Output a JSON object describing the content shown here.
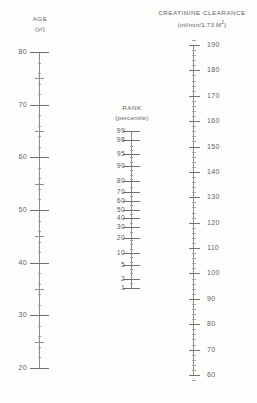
{
  "figure": {
    "type": "nomogram",
    "background_color": "#fdfdfc",
    "ink_color": "#6e6e6e"
  },
  "age_axis": {
    "title": "AGE",
    "subtitle": "(yr)",
    "unit": "yr",
    "label_side": "left",
    "scale": "linear",
    "range": [
      20,
      80
    ],
    "top_value": 80,
    "bottom_value": 20,
    "top_y": 52,
    "bottom_y": 368,
    "major_step": 10,
    "mid_step": 5,
    "minor_step": 2,
    "major_ticks": [
      80,
      70,
      60,
      50,
      40,
      30,
      20
    ],
    "labels": [
      "80",
      "70",
      "60",
      "50",
      "40",
      "30",
      "20"
    ]
  },
  "rank_axis": {
    "title": "RANK",
    "subtitle": "(percentile)",
    "unit": "percentile",
    "label_side": "left",
    "scale": "probit",
    "top_y": 131,
    "bottom_y": 288,
    "ticks": [
      99,
      98,
      95,
      90,
      80,
      70,
      60,
      50,
      40,
      30,
      20,
      10,
      5,
      2,
      1
    ],
    "labels": [
      "99",
      "98",
      "95",
      "90",
      "80",
      "70",
      "60",
      "50",
      "40",
      "30",
      "20",
      "10",
      "5",
      "2",
      "1"
    ]
  },
  "clearance_axis": {
    "title": "CREATININE CLEARANCE",
    "subtitle": "(ml/min/1.73 M²)",
    "subtitle_parts": {
      "pre": "(ml/min/1.73 M",
      "sup": "2",
      "post": ")"
    },
    "unit": "ml/min/1.73 M2",
    "label_side": "right",
    "scale": "linear",
    "range": [
      60,
      190
    ],
    "top_value": 190,
    "bottom_value": 60,
    "top_y": 45,
    "bottom_y": 375,
    "major_step": 10,
    "minor_step": 2,
    "major_ticks": [
      190,
      180,
      170,
      160,
      150,
      140,
      130,
      120,
      110,
      100,
      90,
      80,
      70,
      60
    ],
    "labels": [
      "190",
      "180",
      "170",
      "160",
      "150",
      "140",
      "130",
      "120",
      "110",
      "100",
      "90",
      "80",
      "70",
      "60"
    ]
  },
  "chart_data": {
    "type": "line",
    "xlabel": "",
    "ylabel": "",
    "grid": false,
    "legend": "none",
    "series": [
      {
        "name": "AGE (yr)",
        "axis_x_px": 39,
        "orientation": "vertical",
        "values": [
          80,
          70,
          60,
          50,
          40,
          30,
          20
        ],
        "ylim": [
          20,
          80
        ]
      },
      {
        "name": "RANK (percentile)",
        "axis_x_px": 131,
        "orientation": "vertical",
        "values": [
          99,
          98,
          95,
          90,
          80,
          70,
          60,
          50,
          40,
          30,
          20,
          10,
          5,
          2,
          1
        ],
        "ylim": [
          1,
          99
        ]
      },
      {
        "name": "CREATININE CLEARANCE (ml/min/1.73 M2)",
        "axis_x_px": 193,
        "orientation": "vertical",
        "values": [
          190,
          180,
          170,
          160,
          150,
          140,
          130,
          120,
          110,
          100,
          90,
          80,
          70,
          60
        ],
        "ylim": [
          60,
          190
        ]
      }
    ]
  }
}
